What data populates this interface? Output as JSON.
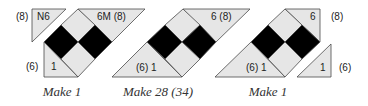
{
  "colors": {
    "light": "#e6e6e6",
    "dark": "#000000",
    "stroke": "#4a4a4a",
    "text": "#222222"
  },
  "units": [
    {
      "caption": "Make 1",
      "detached_triangle": {
        "label": "N6",
        "side_label": "(8)"
      },
      "top_triangle": {
        "label": "6M (8)"
      },
      "bottom_triangle": {
        "label": "1",
        "side_label": "(6)"
      }
    },
    {
      "caption": "Make 28 (34)",
      "top_triangle": {
        "label": "6 (8)"
      },
      "bottom_triangle": {
        "label": "(6) 1"
      }
    },
    {
      "caption": "Make 1",
      "top_triangle": {
        "label": "6",
        "side_label": "(8)"
      },
      "bottom_triangle": {
        "label": "(6) 1"
      },
      "detached_triangle": {
        "label": "1",
        "side_label": "(6)"
      }
    }
  ]
}
